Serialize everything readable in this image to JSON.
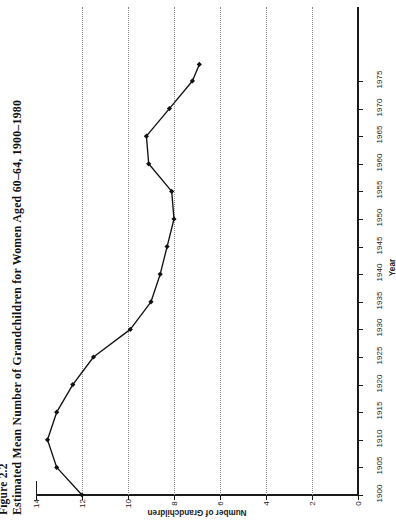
{
  "figure": {
    "number": "Figure 2.2",
    "caption": "Estimated Mean Number of Grandchildren for Women Aged 60–64, 1900–1980"
  },
  "chart_data": {
    "type": "line",
    "orientation": "page-rotated-90-ccw",
    "xlabel": "Year",
    "ylabel": "Number of Grandchildren",
    "xlim": [
      1900,
      1980
    ],
    "ylim": [
      0,
      14
    ],
    "xticks": [
      1900,
      1905,
      1910,
      1915,
      1920,
      1925,
      1930,
      1935,
      1940,
      1945,
      1950,
      1955,
      1960,
      1965,
      1970,
      1975
    ],
    "yticks": [
      0,
      2,
      4,
      6,
      8,
      10,
      12,
      14
    ],
    "grid": "dotted-vertical-at-value-ticks",
    "legend": "none",
    "markers": "filled-diamond",
    "x": [
      1900,
      1905,
      1910,
      1915,
      1920,
      1925,
      1930,
      1935,
      1940,
      1945,
      1950,
      1955,
      1960,
      1965,
      1970,
      1975,
      1978
    ],
    "values": [
      12.0,
      13.1,
      13.5,
      13.1,
      12.4,
      11.5,
      9.9,
      9.0,
      8.6,
      8.3,
      8.0,
      8.1,
      9.1,
      9.2,
      8.2,
      7.2,
      6.9
    ],
    "series": [
      {
        "name": "Estimated mean number of grandchildren",
        "values": [
          12.0,
          13.1,
          13.5,
          13.1,
          12.4,
          11.5,
          9.9,
          9.0,
          8.6,
          8.3,
          8.0,
          8.1,
          9.1,
          9.2,
          8.2,
          7.2,
          6.9
        ]
      }
    ]
  },
  "axes": {
    "value_axis": {
      "title": "Number of Grandchildren",
      "tick_labels": [
        "14",
        "12",
        "10",
        "8",
        "6",
        "4",
        "2",
        "0"
      ],
      "ticks": [
        14,
        12,
        10,
        8,
        6,
        4,
        2,
        0
      ]
    },
    "year_axis": {
      "title": "Year",
      "tick_labels": [
        "1900",
        "1905",
        "1910",
        "1915",
        "1920",
        "1925",
        "1930",
        "1935",
        "1940",
        "1945",
        "1950",
        "1955",
        "1960",
        "1965",
        "1970",
        "1975"
      ],
      "ticks": [
        1900,
        1905,
        1910,
        1915,
        1920,
        1925,
        1930,
        1935,
        1940,
        1945,
        1950,
        1955,
        1960,
        1965,
        1970,
        1975
      ]
    }
  },
  "colors": {
    "ink": "#121212",
    "grid": "#8a8a8a",
    "paper": "#ffffff"
  }
}
